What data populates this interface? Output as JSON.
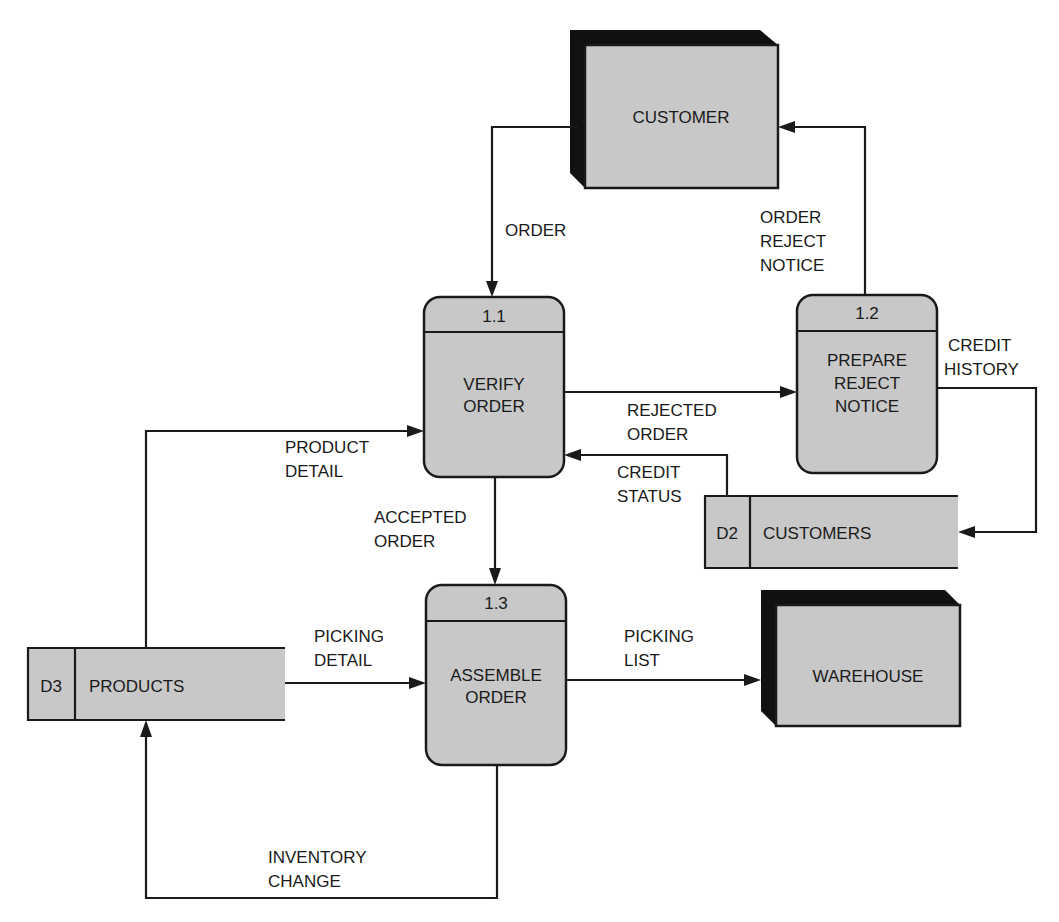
{
  "diagram": {
    "type": "data flow diagram",
    "external_entities": [
      {
        "id": "customer",
        "label": "CUSTOMER"
      },
      {
        "id": "warehouse",
        "label": "WAREHOUSE"
      }
    ],
    "processes": [
      {
        "id": "1.1",
        "number": "1.1",
        "line1": "VERIFY",
        "line2": "ORDER"
      },
      {
        "id": "1.2",
        "number": "1.2",
        "line1": "PREPARE",
        "line2": "REJECT",
        "line3": "NOTICE"
      },
      {
        "id": "1.3",
        "number": "1.3",
        "line1": "ASSEMBLE",
        "line2": "ORDER"
      }
    ],
    "data_stores": [
      {
        "id": "D2",
        "code": "D2",
        "label": "CUSTOMERS"
      },
      {
        "id": "D3",
        "code": "D3",
        "label": "PRODUCTS"
      }
    ],
    "flows": [
      {
        "from": "CUSTOMER",
        "to": "1.1",
        "line1": "ORDER"
      },
      {
        "from": "1.2",
        "to": "CUSTOMER",
        "line1": "ORDER",
        "line2": "REJECT",
        "line3": "NOTICE"
      },
      {
        "from": "1.1",
        "to": "1.2",
        "line1": "REJECTED",
        "line2": "ORDER"
      },
      {
        "from": "1.2",
        "to": "D2",
        "line1": "CREDIT",
        "line2": "HISTORY"
      },
      {
        "from": "D2",
        "to": "1.1",
        "line1": "CREDIT",
        "line2": "STATUS"
      },
      {
        "from": "D3",
        "to": "1.1",
        "line1": "PRODUCT",
        "line2": "DETAIL"
      },
      {
        "from": "1.1",
        "to": "1.3",
        "line1": "ACCEPTED",
        "line2": "ORDER"
      },
      {
        "from": "D3",
        "to": "1.3",
        "line1": "PICKING",
        "line2": "DETAIL"
      },
      {
        "from": "1.3",
        "to": "WAREHOUSE",
        "line1": "PICKING",
        "line2": "LIST"
      },
      {
        "from": "1.3",
        "to": "D3",
        "line1": "INVENTORY",
        "line2": "CHANGE"
      }
    ]
  },
  "colors": {
    "fill": "#c8c8c8",
    "stroke": "#1a1a1a",
    "shadow": "#111111"
  }
}
